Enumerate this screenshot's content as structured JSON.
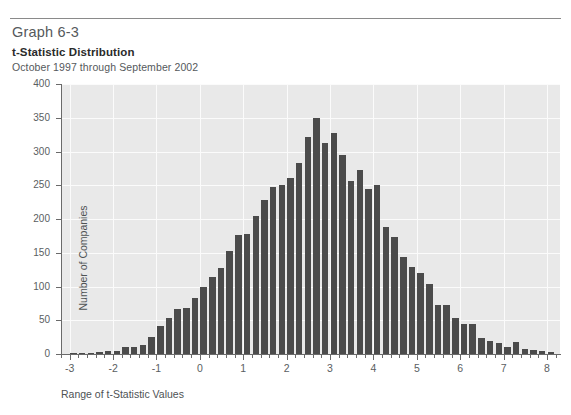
{
  "header": {
    "graph_number": "Graph 6-3",
    "title": "t-Statistic Distribution",
    "subtitle": "October 1997 through September 2002"
  },
  "colors": {
    "bar": "#4b4b4b",
    "plot_background": "#e9e9e9",
    "gridline": "#fbfbfb",
    "axis": "#6a6a6a",
    "text": "#5a5e61"
  },
  "chart_data": {
    "type": "bar",
    "title": "t-Statistic Distribution",
    "subtitle": "October 1997 through September 2002",
    "xlabel": "Range of t-Statistic Values",
    "ylabel": "Number of Companies",
    "xlim": [
      -3.2,
      8.3
    ],
    "ylim": [
      0,
      400
    ],
    "ytick_labels": [
      "0",
      "50",
      "100",
      "150",
      "200",
      "250",
      "300",
      "350",
      "400"
    ],
    "ytick_values": [
      0,
      50,
      100,
      150,
      200,
      250,
      300,
      350,
      400
    ],
    "xtick_labels": [
      "-3",
      "-2",
      "-1",
      "0",
      "1",
      "2",
      "3",
      "4",
      "5",
      "6",
      "7",
      "8"
    ],
    "xtick_values": [
      -3,
      -2,
      -1,
      0,
      1,
      2,
      3,
      4,
      5,
      6,
      7,
      8
    ],
    "grid": true,
    "legend": null,
    "bar_width": 0.2,
    "x": [
      -2.9,
      -2.7,
      -2.5,
      -2.3,
      -2.1,
      -1.9,
      -1.7,
      -1.5,
      -1.3,
      -1.1,
      -0.9,
      -0.7,
      -0.5,
      -0.3,
      -0.1,
      0.1,
      0.3,
      0.5,
      0.7,
      0.9,
      1.1,
      1.3,
      1.5,
      1.7,
      1.9,
      2.1,
      2.3,
      2.5,
      2.7,
      2.9,
      3.1,
      3.3,
      3.5,
      3.7,
      3.9,
      4.1,
      4.3,
      4.5,
      4.7,
      4.9,
      5.1,
      5.3,
      5.5,
      5.7,
      5.9,
      6.1,
      6.3,
      6.5,
      6.7,
      6.9,
      7.1,
      7.3,
      7.5,
      7.7,
      7.9,
      8.1
    ],
    "values": [
      1,
      2,
      2,
      3,
      4,
      5,
      10,
      11,
      14,
      25,
      42,
      53,
      66,
      68,
      83,
      99,
      114,
      128,
      152,
      176,
      178,
      205,
      228,
      248,
      250,
      261,
      283,
      322,
      350,
      312,
      327,
      295,
      257,
      272,
      245,
      250,
      188,
      174,
      144,
      129,
      120,
      103,
      72,
      72,
      53,
      44,
      44,
      24,
      20,
      17,
      11,
      18,
      8,
      6,
      5,
      3
    ],
    "annotations": []
  },
  "axes": {
    "x_title": "Range of t-Statistic Values",
    "y_title": "Number of Companies"
  }
}
